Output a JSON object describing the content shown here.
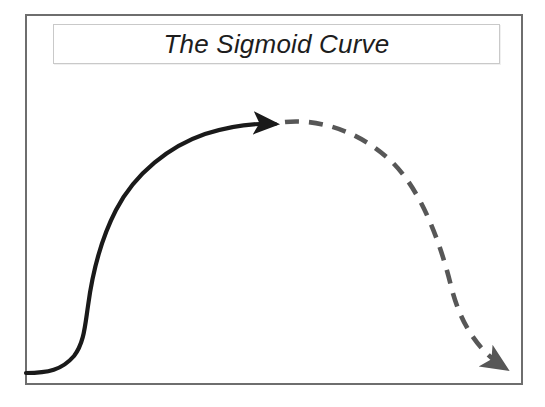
{
  "figure": {
    "kind": "conceptual-line-diagram",
    "title": "The Sigmoid Curve",
    "background_color": "#ffffff",
    "frame": {
      "name": "diagram-frame",
      "border_color": "#6e6e6e",
      "border_width_px": 2,
      "x": 25,
      "y": 14,
      "width": 498,
      "height": 371
    },
    "title_plate": {
      "border_color": "#c9c9c9",
      "fill_color": "#ffffff",
      "x": 53,
      "y": 24,
      "width": 447,
      "height": 40,
      "font_style": "italic",
      "font_size_px": 26,
      "text_color": "#1d1d1d",
      "align": "center"
    }
  },
  "chart_data": {
    "type": "line",
    "title": "The Sigmoid Curve",
    "subtitle": "",
    "xlabel": "",
    "ylabel": "",
    "xlim": [
      25,
      523
    ],
    "ylim": [
      385,
      14
    ],
    "grid": false,
    "legend": "none",
    "axis_ticks": "none",
    "tick_labels": [],
    "annotations": [
      {
        "name": "growth-arrowhead",
        "kind": "arrowhead",
        "x": 277,
        "y": 124,
        "direction": "right",
        "color": "#1a1a1a"
      },
      {
        "name": "decline-arrowhead",
        "kind": "arrowhead",
        "x": 523,
        "y": 375,
        "direction": "right-down",
        "color": "#575757"
      }
    ],
    "series": [
      {
        "name": "Growth phase (solid)",
        "style": "solid",
        "color": "#1a1a1a",
        "width_px": 4.2,
        "arrow_end": true,
        "path": "M 26 373 C 48 373, 62 370, 74 356 C 84 343, 85 326, 88 306 C 92 276, 100 241, 116 210 C 135 173, 170 146, 205 134 C 230 126, 255 123, 275 124",
        "points": [
          [
            26,
            373
          ],
          [
            45,
            373
          ],
          [
            60,
            371
          ],
          [
            72,
            360
          ],
          [
            82,
            345
          ],
          [
            87,
            322
          ],
          [
            90,
            300
          ],
          [
            96,
            270
          ],
          [
            106,
            238
          ],
          [
            120,
            207
          ],
          [
            140,
            180
          ],
          [
            165,
            157
          ],
          [
            195,
            139
          ],
          [
            230,
            128
          ],
          [
            258,
            124
          ],
          [
            275,
            124
          ]
        ]
      },
      {
        "name": "Decline phase (dashed)",
        "style": "dashed",
        "color": "#575757",
        "width_px": 4.6,
        "dash_px": 14,
        "gap_px": 10,
        "arrow_end": true,
        "path": "M 285 122 C 315 119, 355 128, 390 160 C 420 188, 440 240, 452 290 C 462 327, 480 352, 505 368",
        "points": [
          [
            285,
            122
          ],
          [
            300,
            121
          ],
          [
            320,
            123
          ],
          [
            345,
            132
          ],
          [
            368,
            146
          ],
          [
            390,
            168
          ],
          [
            410,
            200
          ],
          [
            428,
            240
          ],
          [
            443,
            280
          ],
          [
            452,
            312
          ],
          [
            466,
            340
          ],
          [
            487,
            358
          ],
          [
            505,
            368
          ]
        ]
      }
    ]
  }
}
